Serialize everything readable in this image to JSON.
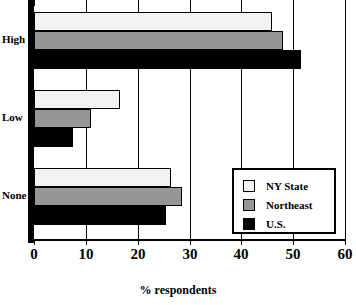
{
  "chart_data": {
    "type": "bar",
    "orientation": "horizontal",
    "title": "",
    "xlabel": "% respondents",
    "ylabel": "",
    "categories": [
      "High",
      "Low",
      "None"
    ],
    "series": [
      {
        "name": "NY State",
        "color": "#f2f2f2",
        "values": [
          46,
          16.5,
          26.5
        ]
      },
      {
        "name": "Northeast",
        "color": "#969696",
        "values": [
          48,
          11,
          28.5
        ]
      },
      {
        "name": "U.S.",
        "color": "#000000",
        "values": [
          51.5,
          7.5,
          25.5
        ]
      }
    ],
    "xlim": [
      0,
      60
    ],
    "xticks": [
      0,
      10,
      20,
      30,
      40,
      50,
      60
    ],
    "xtick_labels": [
      "0",
      "10",
      "20",
      "30",
      "40",
      "50",
      "60"
    ],
    "grid": true,
    "legend_position": "bottom-right"
  }
}
